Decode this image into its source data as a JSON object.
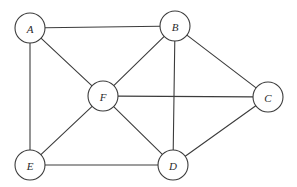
{
  "figure": {
    "type": "undirected-graph",
    "width": 297,
    "height": 187,
    "background_color": "#ffffff",
    "stroke_color": "#3c3c3c",
    "label_color": "#2b2b2b",
    "node_fill": "#ffffff",
    "node_radius": 15
  },
  "nodes": [
    {
      "id": "A",
      "label": "A",
      "x": 30,
      "y": 28
    },
    {
      "id": "B",
      "label": "B",
      "x": 175,
      "y": 26
    },
    {
      "id": "C",
      "label": "C",
      "x": 268,
      "y": 97
    },
    {
      "id": "D",
      "label": "D",
      "x": 173,
      "y": 165
    },
    {
      "id": "E",
      "label": "E",
      "x": 30,
      "y": 165
    },
    {
      "id": "F",
      "label": "F",
      "x": 103,
      "y": 96
    }
  ],
  "edges": [
    {
      "from": "A",
      "to": "B"
    },
    {
      "from": "A",
      "to": "E"
    },
    {
      "from": "A",
      "to": "F"
    },
    {
      "from": "B",
      "to": "C"
    },
    {
      "from": "B",
      "to": "D"
    },
    {
      "from": "B",
      "to": "F"
    },
    {
      "from": "C",
      "to": "D"
    },
    {
      "from": "C",
      "to": "F"
    },
    {
      "from": "D",
      "to": "E"
    },
    {
      "from": "D",
      "to": "F"
    },
    {
      "from": "E",
      "to": "F"
    }
  ]
}
